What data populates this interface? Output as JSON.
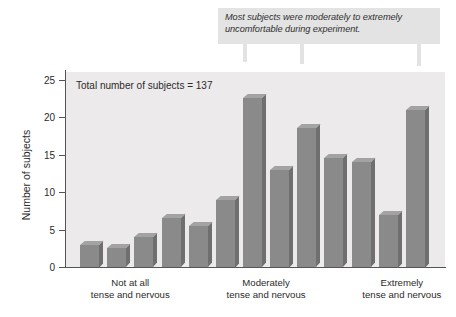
{
  "figure": {
    "callout_text": "Most subjects were moderately to extremely uncomfortable during experiment.",
    "plot_note": "Total number of subjects = 137",
    "colors": {
      "bar_front": "#8a8a8a",
      "bar_top": "#a3a3a3",
      "bar_side": "#6f6f6f",
      "plot_background": "#eceaea",
      "callout_background": "#e3e3e3",
      "axis": "#555555",
      "text": "#2b2b2b"
    }
  },
  "chart_data": {
    "type": "bar",
    "title": "",
    "xlabel": "",
    "ylabel": "Number of subjects",
    "ylim": [
      0,
      26
    ],
    "yticks": [
      0,
      5,
      10,
      15,
      20,
      25
    ],
    "ytick_labels": [
      "0",
      "5",
      "10",
      "15",
      "20",
      "25"
    ],
    "grid": false,
    "legend": "none",
    "categories": [
      "1",
      "2",
      "3",
      "4",
      "5",
      "6",
      "7",
      "8",
      "9",
      "10",
      "11",
      "12",
      "13"
    ],
    "values": [
      3,
      2.5,
      4,
      6.5,
      5.5,
      9,
      22.5,
      13,
      18.5,
      14.5,
      14,
      7,
      21
    ],
    "category_axis_labels": [
      {
        "line1": "Not at all",
        "line2": "tense and nervous"
      },
      {
        "line1": "Moderately",
        "line2": "tense and nervous"
      },
      {
        "line1": "Extremely",
        "line2": "tense and nervous"
      }
    ],
    "annotations": [
      {
        "text": "Total number of subjects = 137",
        "kind": "in-plot-note"
      },
      {
        "text": "Most subjects were moderately to extremely uncomfortable during experiment.",
        "kind": "callout",
        "points_to_bars": [
          7,
          9,
          13
        ]
      }
    ]
  }
}
